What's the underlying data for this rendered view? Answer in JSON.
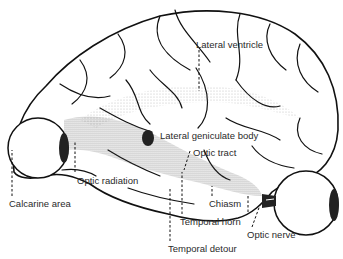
{
  "figure": {
    "colors": {
      "ink": "#111111",
      "label_text": "#2a2a2a",
      "background": "#ffffff",
      "stipple": "#555555"
    }
  },
  "labels": [
    {
      "id": "lateral-ventricle",
      "text": "Lateral ventricle",
      "x": 196,
      "y": 39
    },
    {
      "id": "lateral-geniculate-body",
      "text": "Lateral geniculate body",
      "x": 160,
      "y": 130
    },
    {
      "id": "optic-tract",
      "text": "Optic tract",
      "x": 193,
      "y": 147
    },
    {
      "id": "optic-radiation",
      "text": "Optic radiation",
      "x": 77,
      "y": 175
    },
    {
      "id": "calcarine-area",
      "text": "Calcarine area",
      "x": 9,
      "y": 198
    },
    {
      "id": "chiasm",
      "text": "Chiasm",
      "x": 209,
      "y": 198
    },
    {
      "id": "temporal-horn",
      "text": "Temporal horn",
      "x": 180,
      "y": 216
    },
    {
      "id": "optic-nerve",
      "text": "Optic nerve",
      "x": 247,
      "y": 229
    },
    {
      "id": "temporal-detour",
      "text": "Temporal detour",
      "x": 168,
      "y": 243
    }
  ],
  "leader_lines": [
    {
      "to": "lateral-ventricle",
      "x1": 199,
      "y1": 50,
      "x2": 199,
      "y2": 91
    },
    {
      "to": "optic-tract",
      "x1": 190,
      "y1": 151,
      "x2": 184,
      "y2": 170
    },
    {
      "to": "optic-radiation",
      "x1": 75,
      "y1": 178,
      "x2": 75,
      "y2": 142
    },
    {
      "to": "calcarine-area",
      "x1": 12,
      "y1": 196,
      "x2": 12,
      "y2": 150
    },
    {
      "to": "chiasm",
      "x1": 212,
      "y1": 196,
      "x2": 212,
      "y2": 186
    },
    {
      "to": "temporal-horn",
      "x1": 182,
      "y1": 214,
      "x2": 182,
      "y2": 172
    },
    {
      "to": "optic-nerve",
      "x1": 252,
      "y1": 227,
      "x2": 260,
      "y2": 205
    },
    {
      "to": "temporal-detour",
      "x1": 170,
      "y1": 241,
      "x2": 170,
      "y2": 187
    },
    {
      "to": "lgb-chiasm-ext",
      "x1": 248,
      "y1": 212,
      "x2": 248,
      "y2": 196
    }
  ],
  "structures": [
    {
      "id": "left-eyeball",
      "cx": 38,
      "cy": 148,
      "r": 30
    },
    {
      "id": "right-eyeball",
      "cx": 306,
      "cy": 203,
      "r": 32
    }
  ]
}
